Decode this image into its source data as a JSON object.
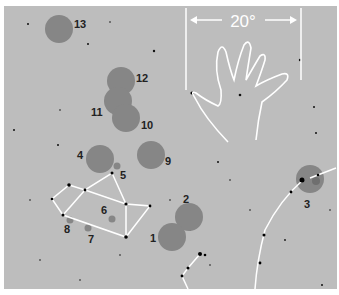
{
  "figure": {
    "scale_label": "20°",
    "background": "#bdbdbd",
    "circle_color": "#858585",
    "line_color": "#ffffff"
  },
  "objects": [
    {
      "id": "1",
      "label": "1"
    },
    {
      "id": "2",
      "label": "2"
    },
    {
      "id": "3",
      "label": "3"
    },
    {
      "id": "4",
      "label": "4"
    },
    {
      "id": "5",
      "label": "5"
    },
    {
      "id": "6",
      "label": "6"
    },
    {
      "id": "7",
      "label": "7"
    },
    {
      "id": "8",
      "label": "8"
    },
    {
      "id": "9",
      "label": "9"
    },
    {
      "id": "10",
      "label": "10"
    },
    {
      "id": "11",
      "label": "11"
    },
    {
      "id": "12",
      "label": "12"
    },
    {
      "id": "13",
      "label": "13"
    }
  ]
}
